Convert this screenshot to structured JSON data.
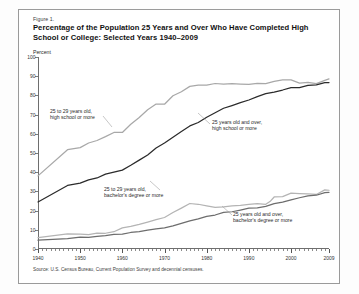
{
  "figure": {
    "number_label": "Figure 1.",
    "title_line1": "Percentage of the Population 25 Years and Over Who Have Completed",
    "title_line2": "High School or College: Selected Years 1940–2009",
    "axis_unit_label": "Percent",
    "source": "Source: U.S. Census Bureau, Current Population Survey and decennial censuses."
  },
  "annotations": [
    {
      "id": "a1",
      "line1": "25 to 29 years old,",
      "line2": "high school or more"
    },
    {
      "id": "a2",
      "line1": "25 years old and over,",
      "line2": "high school or more"
    },
    {
      "id": "a3",
      "line1": "25 to 29 years old,",
      "line2": "bachelor's degree or more"
    },
    {
      "id": "a4",
      "line1": "25 years old and over,",
      "line2": "bachelor's degree or more"
    }
  ],
  "colors": {
    "hs_25to29": "#a8a8a8",
    "hs_25plus": "#2b2b2b",
    "ba_25to29": "#b4b4b4",
    "ba_25plus": "#6d6d6d",
    "axis": "#6e6e6e",
    "frame": "#9a9a9a"
  },
  "chart_data": {
    "type": "line",
    "title": "Percentage of the Population 25 Years and Over Who Have Completed High School or College: Selected Years 1940–2009",
    "xlabel": "",
    "ylabel": "Percent",
    "xlim": [
      1940,
      2009
    ],
    "ylim": [
      0,
      100
    ],
    "yticks": [
      0,
      10,
      20,
      30,
      40,
      50,
      60,
      70,
      80,
      90,
      100
    ],
    "xticks_major": [
      1940,
      1950,
      1960,
      1970,
      1980,
      1990,
      2000,
      2009
    ],
    "xtick_minor_step": 1,
    "grid": false,
    "legend": "annotated-inline",
    "series": [
      {
        "name": "25 to 29 years old, high school or more",
        "color": "#a8a8a8",
        "x": [
          1940,
          1947,
          1950,
          1952,
          1954,
          1956,
          1958,
          1960,
          1962,
          1964,
          1966,
          1968,
          1970,
          1972,
          1974,
          1976,
          1978,
          1980,
          1982,
          1984,
          1986,
          1988,
          1990,
          1992,
          1994,
          1996,
          1998,
          2000,
          2002,
          2004,
          2006,
          2008,
          2009
        ],
        "values": [
          38.1,
          51.7,
          52.8,
          55.2,
          56.5,
          58.5,
          60.7,
          60.7,
          65.0,
          68.5,
          72.5,
          75.5,
          75.4,
          79.8,
          81.9,
          84.7,
          85.3,
          85.4,
          86.2,
          85.9,
          86.1,
          85.9,
          85.7,
          86.3,
          86.1,
          87.3,
          88.1,
          88.1,
          86.4,
          86.8,
          86.1,
          87.8,
          88.6
        ]
      },
      {
        "name": "25 years old and over, high school or more",
        "color": "#2b2b2b",
        "x": [
          1940,
          1947,
          1950,
          1952,
          1954,
          1956,
          1958,
          1960,
          1962,
          1964,
          1966,
          1968,
          1970,
          1972,
          1974,
          1976,
          1978,
          1980,
          1982,
          1984,
          1986,
          1988,
          1990,
          1992,
          1994,
          1996,
          1998,
          2000,
          2002,
          2004,
          2006,
          2008,
          2009
        ],
        "values": [
          24.5,
          33.1,
          34.3,
          36.0,
          37.0,
          39.0,
          40.0,
          41.1,
          43.6,
          46.3,
          49.0,
          52.6,
          55.2,
          58.2,
          61.2,
          64.1,
          65.9,
          68.6,
          71.0,
          73.3,
          74.7,
          76.2,
          77.6,
          79.4,
          80.9,
          81.7,
          82.8,
          84.1,
          84.1,
          85.2,
          85.5,
          86.6,
          86.7
        ]
      },
      {
        "name": "25 to 29 years old, bachelor's degree or more",
        "color": "#b4b4b4",
        "x": [
          1940,
          1947,
          1950,
          1952,
          1954,
          1956,
          1958,
          1960,
          1962,
          1964,
          1966,
          1968,
          1970,
          1972,
          1974,
          1976,
          1978,
          1980,
          1982,
          1984,
          1986,
          1988,
          1990,
          1992,
          1994,
          1995,
          1996,
          1998,
          2000,
          2002,
          2004,
          2006,
          2008,
          2009
        ],
        "values": [
          5.9,
          7.9,
          7.7,
          7.5,
          8.3,
          8.2,
          9.0,
          11.0,
          11.8,
          12.8,
          14.0,
          15.3,
          16.4,
          19.0,
          21.3,
          23.7,
          23.3,
          22.5,
          21.7,
          21.9,
          22.4,
          22.7,
          23.2,
          23.6,
          23.3,
          24.7,
          27.1,
          27.3,
          29.1,
          28.9,
          28.7,
          28.4,
          30.8,
          30.6
        ]
      },
      {
        "name": "25 years old and over, bachelor's degree or more",
        "color": "#6d6d6d",
        "x": [
          1940,
          1947,
          1950,
          1952,
          1954,
          1956,
          1958,
          1960,
          1962,
          1964,
          1966,
          1968,
          1970,
          1972,
          1974,
          1976,
          1978,
          1980,
          1982,
          1984,
          1986,
          1988,
          1990,
          1992,
          1994,
          1996,
          1998,
          2000,
          2002,
          2004,
          2006,
          2008,
          2009
        ],
        "values": [
          4.6,
          5.4,
          6.2,
          6.0,
          6.6,
          7.0,
          7.6,
          7.7,
          8.6,
          9.1,
          9.8,
          10.5,
          11.0,
          12.0,
          13.3,
          14.7,
          15.7,
          17.0,
          17.7,
          19.1,
          19.4,
          20.3,
          21.3,
          21.4,
          22.2,
          23.6,
          24.4,
          25.6,
          26.7,
          27.7,
          28.0,
          29.4,
          29.5
        ]
      }
    ]
  }
}
